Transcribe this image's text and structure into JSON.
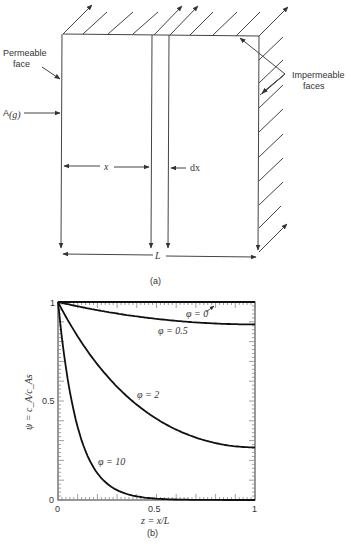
{
  "diagram_a": {
    "caption": "(a)",
    "labels": {
      "permeable_line1": "Permeable",
      "permeable_line2": "face",
      "impermeable_line1": "Impermeable",
      "impermeable_line2": "faces",
      "species": "A",
      "species_sub": "(g)",
      "x": "x",
      "dx": "dx",
      "L": "L"
    }
  },
  "chart_data": {
    "type": "line",
    "title": "",
    "caption": "(b)",
    "xlabel": "z = x/L",
    "ylabel": "ψ = c_A/c_As",
    "xlim": [
      0,
      1
    ],
    "ylim": [
      0,
      1
    ],
    "xticks": [
      "0",
      "0.5",
      "1"
    ],
    "yticks": [
      "0",
      "0.5",
      "1"
    ],
    "grid": false,
    "x": [
      0,
      0.1,
      0.2,
      0.3,
      0.4,
      0.5,
      0.6,
      0.7,
      0.8,
      0.9,
      1.0
    ],
    "series": [
      {
        "name": "φ = 0",
        "values": [
          1,
          1,
          1,
          1,
          1,
          1,
          1,
          1,
          1,
          1,
          1
        ]
      },
      {
        "name": "φ = 0.5",
        "values": [
          1,
          0.956,
          0.922,
          0.896,
          0.877,
          0.864,
          0.856,
          0.852,
          0.851,
          0.851,
          0.887
        ]
      },
      {
        "name": "φ = 2",
        "values": [
          1,
          0.826,
          0.685,
          0.571,
          0.48,
          0.408,
          0.352,
          0.311,
          0.283,
          0.27,
          0.266
        ]
      },
      {
        "name": "φ = 10",
        "values": [
          1,
          0.368,
          0.135,
          0.05,
          0.018,
          0.007,
          0.0025,
          0.0009,
          0.0004,
          0.0002,
          0.0001
        ]
      }
    ],
    "annotations": [
      "φ = 0",
      "φ = 0.5",
      "φ = 2",
      "φ = 10"
    ]
  }
}
